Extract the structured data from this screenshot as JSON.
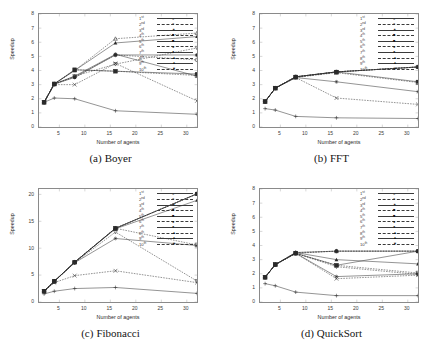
{
  "figure": {
    "panels": [
      {
        "id": "boyer",
        "caption_index": "(a)",
        "caption_text": "Boyer",
        "xlabel": "Number of agents",
        "ylabel": "Speedup",
        "yticks": [
          "0",
          "1",
          "2",
          "3",
          "4",
          "5",
          "6",
          "7",
          "8"
        ],
        "xticks": [
          "5",
          "10",
          "15",
          "20",
          "25",
          "30"
        ]
      },
      {
        "id": "fft",
        "caption_index": "(b)",
        "caption_text": "FFT",
        "xlabel": "Number of agents",
        "ylabel": "Speedup",
        "yticks": [
          "0",
          "1",
          "2",
          "3",
          "4",
          "5",
          "6",
          "7",
          "8"
        ],
        "xticks": [
          "5",
          "10",
          "15",
          "20",
          "25",
          "30"
        ]
      },
      {
        "id": "fibonacci",
        "caption_index": "(c)",
        "caption_text": "Fibonacci",
        "xlabel": "Number of agents",
        "ylabel": "Speedup",
        "yticks": [
          "0",
          "5",
          "10",
          "15",
          "20"
        ],
        "xticks": [
          "5",
          "10",
          "15",
          "20",
          "25",
          "30"
        ]
      },
      {
        "id": "quicksort",
        "caption_index": "(d)",
        "caption_text": "QuickSort",
        "xlabel": "Number of agents",
        "ylabel": "Speedup",
        "yticks": [
          "0",
          "1",
          "2",
          "3",
          "4",
          "5",
          "6",
          "7",
          "8"
        ],
        "xticks": [
          "5",
          "10",
          "15",
          "20",
          "25",
          "30"
        ]
      }
    ],
    "legend_entries": [
      {
        "num": "1",
        "ord": "st",
        "marker": "+"
      },
      {
        "num": "2",
        "ord": "nd",
        "marker": "×"
      },
      {
        "num": "3",
        "ord": "rd",
        "marker": "✶"
      },
      {
        "num": "4",
        "ord": "th",
        "marker": "■"
      },
      {
        "num": "5",
        "ord": "th",
        "marker": "■"
      },
      {
        "num": "6",
        "ord": "th",
        "marker": "●"
      },
      {
        "num": "7",
        "ord": "th",
        "marker": "●"
      },
      {
        "num": "8",
        "ord": "th",
        "marker": "▲"
      },
      {
        "num": "9",
        "ord": "th",
        "marker": "▲"
      },
      {
        "num": "10",
        "ord": "th",
        "marker": "▼"
      }
    ]
  },
  "chart_data": [
    {
      "type": "line",
      "title": "(a) Boyer",
      "xlabel": "Number of agents",
      "ylabel": "Speedup",
      "xlim": [
        1,
        32
      ],
      "ylim": [
        0,
        8
      ],
      "xticks": [
        5,
        10,
        15,
        20,
        25,
        30
      ],
      "yticks": [
        0,
        1,
        2,
        3,
        4,
        5,
        6,
        7,
        8
      ],
      "grid": false,
      "legend_position": "top-right",
      "x": [
        2,
        4,
        8,
        16,
        32
      ],
      "series": [
        {
          "name": "1st",
          "values": [
            1.75,
            2.05,
            2.0,
            1.15,
            0.9
          ]
        },
        {
          "name": "2nd",
          "values": [
            1.75,
            3.0,
            3.0,
            4.5,
            1.85
          ]
        },
        {
          "name": "3rd",
          "values": [
            1.75,
            3.05,
            3.6,
            5.15,
            3.6
          ]
        },
        {
          "name": "4th",
          "values": [
            1.75,
            3.05,
            4.05,
            3.95,
            3.65
          ]
        },
        {
          "name": "5th",
          "values": [
            1.75,
            3.05,
            4.05,
            3.95,
            3.75
          ]
        },
        {
          "name": "6th",
          "values": [
            1.75,
            3.05,
            3.55,
            5.1,
            4.75
          ]
        },
        {
          "name": "7th",
          "values": [
            1.75,
            3.05,
            3.5,
            5.1,
            5.1
          ]
        },
        {
          "name": "8th",
          "values": [
            1.75,
            3.05,
            4.0,
            6.25,
            6.65
          ]
        },
        {
          "name": "9th",
          "values": [
            1.75,
            3.05,
            4.0,
            5.95,
            6.4
          ]
        },
        {
          "name": "10th",
          "values": [
            1.75,
            3.0,
            3.6,
            4.45,
            5.6
          ]
        }
      ]
    },
    {
      "type": "line",
      "title": "(b) FFT",
      "xlabel": "Number of agents",
      "ylabel": "Speedup",
      "xlim": [
        1,
        32
      ],
      "ylim": [
        0,
        8
      ],
      "xticks": [
        5,
        10,
        15,
        20,
        25,
        30
      ],
      "yticks": [
        0,
        1,
        2,
        3,
        4,
        5,
        6,
        7,
        8
      ],
      "grid": false,
      "legend_position": "top-right",
      "x": [
        2,
        4,
        8,
        16,
        32
      ],
      "series": [
        {
          "name": "1st",
          "values": [
            1.3,
            1.2,
            0.75,
            0.65,
            0.6
          ]
        },
        {
          "name": "2nd",
          "values": [
            1.8,
            2.75,
            3.5,
            2.05,
            1.6
          ]
        },
        {
          "name": "3rd",
          "values": [
            1.8,
            2.75,
            3.5,
            3.2,
            2.5
          ]
        },
        {
          "name": "4th",
          "values": [
            1.8,
            2.75,
            3.5,
            3.85,
            3.15
          ]
        },
        {
          "name": "5th",
          "values": [
            1.8,
            2.75,
            3.55,
            3.9,
            3.2
          ]
        },
        {
          "name": "6th",
          "values": [
            1.8,
            2.75,
            3.55,
            3.9,
            4.25
          ]
        },
        {
          "name": "7th",
          "values": [
            1.8,
            2.75,
            3.55,
            3.9,
            4.25
          ]
        },
        {
          "name": "8th",
          "values": [
            1.8,
            2.75,
            3.55,
            3.9,
            4.25
          ]
        },
        {
          "name": "9th",
          "values": [
            1.8,
            2.75,
            3.55,
            3.9,
            4.25
          ]
        },
        {
          "name": "10th",
          "values": [
            1.8,
            2.75,
            3.55,
            3.9,
            4.25
          ]
        }
      ]
    },
    {
      "type": "line",
      "title": "(c) Fibonacci",
      "xlabel": "Number of agents",
      "ylabel": "Speedup",
      "xlim": [
        1,
        32
      ],
      "ylim": [
        0,
        21
      ],
      "xticks": [
        5,
        10,
        15,
        20,
        25,
        30
      ],
      "yticks": [
        0,
        5,
        10,
        15,
        20
      ],
      "grid": false,
      "legend_position": "top-right",
      "x": [
        2,
        4,
        8,
        16,
        32
      ],
      "series": [
        {
          "name": "1st",
          "values": [
            1.5,
            2.0,
            2.5,
            2.7,
            1.6
          ]
        },
        {
          "name": "2nd",
          "values": [
            2.0,
            3.6,
            4.9,
            5.8,
            3.6
          ]
        },
        {
          "name": "3rd",
          "values": [
            2.0,
            3.85,
            7.3,
            11.8,
            10.5
          ]
        },
        {
          "name": "4th",
          "values": [
            2.0,
            3.85,
            7.4,
            13.7,
            10.6
          ]
        },
        {
          "name": "5th",
          "values": [
            2.0,
            3.85,
            7.4,
            13.7,
            20.1
          ]
        },
        {
          "name": "6th",
          "values": [
            2.0,
            3.85,
            7.4,
            13.7,
            20.1
          ]
        },
        {
          "name": "7th",
          "values": [
            2.0,
            3.85,
            7.4,
            13.7,
            20.1
          ]
        },
        {
          "name": "8th",
          "values": [
            2.0,
            3.85,
            7.4,
            13.7,
            20.1
          ]
        },
        {
          "name": "9th",
          "values": [
            2.0,
            3.85,
            7.4,
            13.6,
            18.9
          ]
        },
        {
          "name": "10th",
          "values": [
            2.0,
            3.8,
            7.3,
            13.0,
            3.9
          ]
        }
      ]
    },
    {
      "type": "line",
      "title": "(d) QuickSort",
      "xlabel": "Number of agents",
      "ylabel": "Speedup",
      "xlim": [
        1,
        32
      ],
      "ylim": [
        0,
        8
      ],
      "xticks": [
        5,
        10,
        15,
        20,
        25,
        30
      ],
      "yticks": [
        0,
        1,
        2,
        3,
        4,
        5,
        6,
        7,
        8
      ],
      "grid": false,
      "legend_position": "top-right",
      "x": [
        2,
        4,
        8,
        16,
        32
      ],
      "series": [
        {
          "name": "1st",
          "values": [
            1.3,
            1.15,
            0.7,
            0.45,
            0.45
          ]
        },
        {
          "name": "2nd",
          "values": [
            1.75,
            2.65,
            3.45,
            1.65,
            1.9
          ]
        },
        {
          "name": "3rd",
          "values": [
            1.75,
            2.65,
            3.45,
            1.8,
            2.0
          ]
        },
        {
          "name": "4th",
          "values": [
            1.75,
            2.65,
            3.45,
            2.6,
            2.05
          ]
        },
        {
          "name": "5th",
          "values": [
            1.75,
            2.65,
            3.45,
            2.6,
            3.6
          ]
        },
        {
          "name": "6th",
          "values": [
            1.75,
            2.65,
            3.45,
            3.6,
            3.6
          ]
        },
        {
          "name": "7th",
          "values": [
            1.75,
            2.65,
            3.5,
            3.6,
            3.6
          ]
        },
        {
          "name": "8th",
          "values": [
            1.75,
            2.65,
            3.5,
            3.6,
            3.6
          ]
        },
        {
          "name": "9th",
          "values": [
            1.75,
            2.65,
            3.5,
            3.0,
            2.7
          ]
        },
        {
          "name": "10th",
          "values": [
            1.75,
            2.65,
            3.45,
            2.5,
            1.95
          ]
        }
      ]
    }
  ]
}
